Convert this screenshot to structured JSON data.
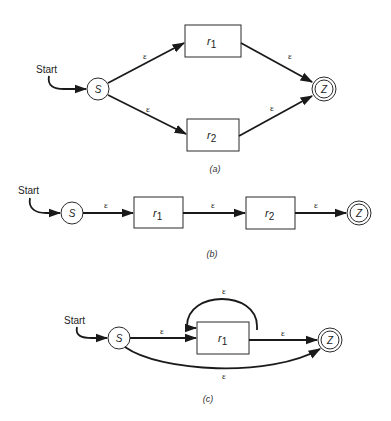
{
  "figure": {
    "panels": [
      {
        "id": "a",
        "caption": "(a)",
        "description": "Union: r1 | r2",
        "start_label": "Start",
        "nodes": {
          "start": {
            "label": "S",
            "type": "state"
          },
          "r1": {
            "label": "r",
            "sub": "1",
            "type": "box"
          },
          "r2": {
            "label": "r",
            "sub": "2",
            "type": "box"
          },
          "final": {
            "label": "Z",
            "type": "accepting-state"
          }
        },
        "edges": [
          {
            "from": "S",
            "to": "r1",
            "label": "ε"
          },
          {
            "from": "S",
            "to": "r2",
            "label": "ε"
          },
          {
            "from": "r1",
            "to": "Z",
            "label": "ε"
          },
          {
            "from": "r2",
            "to": "Z",
            "label": "ε"
          }
        ]
      },
      {
        "id": "b",
        "caption": "(b)",
        "description": "Concatenation: r1 r2",
        "start_label": "Start",
        "nodes": {
          "start": {
            "label": "S",
            "type": "state"
          },
          "r1": {
            "label": "r",
            "sub": "1",
            "type": "box"
          },
          "r2": {
            "label": "r",
            "sub": "2",
            "type": "box"
          },
          "final": {
            "label": "Z",
            "type": "accepting-state"
          }
        },
        "edges": [
          {
            "from": "S",
            "to": "r1",
            "label": "ε"
          },
          {
            "from": "r1",
            "to": "r2",
            "label": "ε"
          },
          {
            "from": "r2",
            "to": "Z",
            "label": "ε"
          }
        ]
      },
      {
        "id": "c",
        "caption": "(c)",
        "description": "Kleene star: r1*",
        "start_label": "Start",
        "nodes": {
          "start": {
            "label": "S",
            "type": "state"
          },
          "r1": {
            "label": "r",
            "sub": "1",
            "type": "box"
          },
          "final": {
            "label": "Z",
            "type": "accepting-state"
          }
        },
        "edges": [
          {
            "from": "S",
            "to": "r1",
            "label": "ε"
          },
          {
            "from": "r1",
            "to": "r1",
            "label": "ε",
            "kind": "loop"
          },
          {
            "from": "r1",
            "to": "Z",
            "label": "ε"
          },
          {
            "from": "S",
            "to": "Z",
            "label": "ε",
            "kind": "bypass"
          }
        ]
      }
    ]
  }
}
